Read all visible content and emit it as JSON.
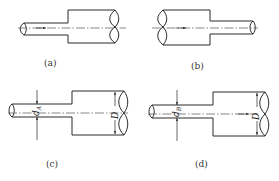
{
  "figure": {
    "panels": [
      {
        "id": "a",
        "caption": "(a)",
        "flow_direction": "right",
        "configuration": "sudden-expansion"
      },
      {
        "id": "b",
        "caption": "(b)",
        "flow_direction": "right",
        "configuration": "sudden-contraction"
      },
      {
        "id": "c",
        "caption": "(c)",
        "small_diameter_label": "d",
        "small_diameter_subscript": "A",
        "large_diameter_label": "D"
      },
      {
        "id": "d",
        "caption": "(d)",
        "small_diameter_label": "d",
        "small_diameter_subscript": "B",
        "large_diameter_label": "D",
        "flow_direction": "right"
      }
    ],
    "colors": {
      "line": "#2a2a2a",
      "background": "#ffffff"
    }
  }
}
